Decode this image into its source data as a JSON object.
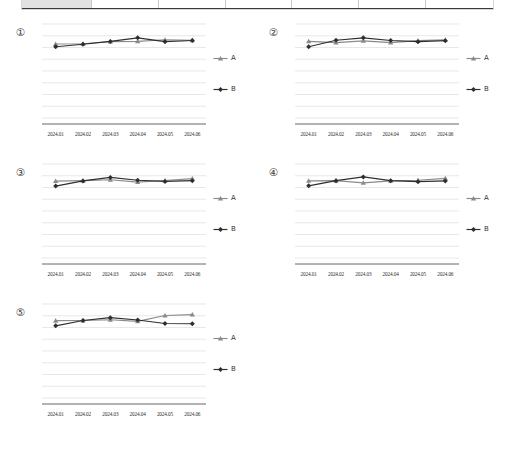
{
  "document": {
    "background_color": "#ffffff",
    "table_strip": {
      "name": "cropped-data-table",
      "shaded_first_cell": true,
      "columns": [
        "",
        "",
        "",
        "",
        "",
        "",
        ""
      ]
    }
  },
  "legend": {
    "series_a_label": "A",
    "series_b_label": "B",
    "series_a_color": "#8a8a8a",
    "series_b_color": "#2e2e2e",
    "marker_a": "triangle",
    "marker_b": "diamond"
  },
  "axis": {
    "categories": [
      "2024.01",
      "2024.02",
      "2024.03",
      "2024.04",
      "2024.05",
      "2024.06"
    ],
    "gridlines": 8,
    "ylim": [
      0,
      8
    ]
  },
  "chart_data": [
    {
      "type": "line",
      "id": "1",
      "index_label": "①",
      "title": "",
      "xlabel": "",
      "ylabel": "",
      "categories": [
        "2024.01",
        "2024.02",
        "2024.03",
        "2024.04",
        "2024.05",
        "2024.06"
      ],
      "ylim": [
        0,
        8
      ],
      "grid": true,
      "legend_position": "right",
      "series": [
        {
          "name": "A",
          "marker": "triangle",
          "color": "#8a8a8a",
          "values": [
            6.3,
            6.32,
            6.5,
            6.52,
            6.66,
            6.62
          ]
        },
        {
          "name": "B",
          "marker": "diamond",
          "color": "#2e2e2e",
          "values": [
            6.06,
            6.28,
            6.52,
            6.82,
            6.5,
            6.6
          ]
        }
      ]
    },
    {
      "type": "line",
      "id": "2",
      "index_label": "②",
      "title": "",
      "xlabel": "",
      "ylabel": "",
      "categories": [
        "2024.01",
        "2024.02",
        "2024.03",
        "2024.04",
        "2024.05",
        "2024.06"
      ],
      "ylim": [
        0,
        8
      ],
      "grid": true,
      "legend_position": "right",
      "series": [
        {
          "name": "A",
          "marker": "triangle",
          "color": "#8a8a8a",
          "values": [
            6.52,
            6.42,
            6.56,
            6.42,
            6.58,
            6.66
          ]
        },
        {
          "name": "B",
          "marker": "diamond",
          "color": "#2e2e2e",
          "values": [
            6.06,
            6.62,
            6.82,
            6.6,
            6.5,
            6.58
          ]
        }
      ]
    },
    {
      "type": "line",
      "id": "3",
      "index_label": "③",
      "title": "",
      "xlabel": "",
      "ylabel": "",
      "categories": [
        "2024.01",
        "2024.02",
        "2024.03",
        "2024.04",
        "2024.05",
        "2024.06"
      ],
      "ylim": [
        0,
        8
      ],
      "grid": true,
      "legend_position": "right",
      "series": [
        {
          "name": "A",
          "marker": "triangle",
          "color": "#8a8a8a",
          "values": [
            6.54,
            6.58,
            6.66,
            6.46,
            6.6,
            6.76
          ]
        },
        {
          "name": "B",
          "marker": "diamond",
          "color": "#2e2e2e",
          "values": [
            6.12,
            6.56,
            6.86,
            6.62,
            6.52,
            6.58
          ]
        }
      ]
    },
    {
      "type": "line",
      "id": "4",
      "index_label": "④",
      "title": "",
      "xlabel": "",
      "ylabel": "",
      "categories": [
        "2024.01",
        "2024.02",
        "2024.03",
        "2024.04",
        "2024.05",
        "2024.06"
      ],
      "ylim": [
        0,
        8
      ],
      "grid": true,
      "legend_position": "right",
      "series": [
        {
          "name": "A",
          "marker": "triangle",
          "color": "#8a8a8a",
          "values": [
            6.56,
            6.58,
            6.4,
            6.56,
            6.62,
            6.78
          ]
        },
        {
          "name": "B",
          "marker": "diamond",
          "color": "#2e2e2e",
          "values": [
            6.14,
            6.58,
            6.9,
            6.58,
            6.5,
            6.56
          ]
        }
      ]
    },
    {
      "type": "line",
      "id": "5",
      "index_label": "⑤",
      "title": "",
      "xlabel": "",
      "ylabel": "",
      "categories": [
        "2024.01",
        "2024.02",
        "2024.03",
        "2024.04",
        "2024.05",
        "2024.06"
      ],
      "ylim": [
        0,
        8
      ],
      "grid": true,
      "legend_position": "right",
      "series": [
        {
          "name": "A",
          "marker": "triangle",
          "color": "#8a8a8a",
          "values": [
            6.58,
            6.6,
            6.66,
            6.52,
            7.02,
            7.1
          ]
        },
        {
          "name": "B",
          "marker": "diamond",
          "color": "#2e2e2e",
          "values": [
            6.14,
            6.6,
            6.84,
            6.64,
            6.34,
            6.32
          ]
        }
      ]
    }
  ]
}
